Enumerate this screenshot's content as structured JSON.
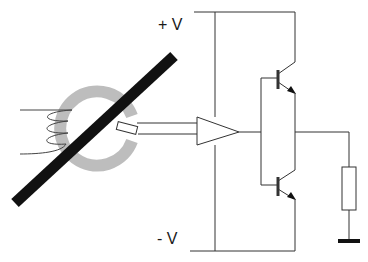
{
  "diagram": {
    "type": "circuit",
    "labels": {
      "positive_supply": "+ V",
      "negative_supply": "- V"
    },
    "components": [
      {
        "id": "conductor",
        "kind": "current-carrying conductor (black bar)"
      },
      {
        "id": "core",
        "kind": "gapped toroidal magnetic core (gray ring)"
      },
      {
        "id": "coil",
        "kind": "compensation winding on core"
      },
      {
        "id": "hall-sensor",
        "kind": "Hall element in core gap"
      },
      {
        "id": "amplifier",
        "kind": "operational amplifier (triangle)"
      },
      {
        "id": "q1",
        "kind": "NPN transistor (upper)"
      },
      {
        "id": "q2",
        "kind": "PNP transistor (lower)"
      },
      {
        "id": "load-resistor",
        "kind": "resistor"
      },
      {
        "id": "ground",
        "kind": "ground symbol"
      }
    ],
    "colors": {
      "line": "#333333",
      "conductor": "#111111",
      "core": "#bdbdbd",
      "background": "#ffffff"
    }
  }
}
